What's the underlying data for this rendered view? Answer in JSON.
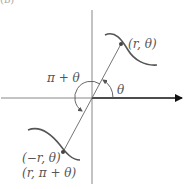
{
  "figure": {
    "corner_label": "(b)",
    "labels": {
      "point_r_theta": "(r, θ)",
      "point_neg_r_theta": "(−r, θ)",
      "point_r_pi_theta": "(r, π + θ)",
      "angle_theta": "θ",
      "angle_pi_plus_theta": "π + θ"
    },
    "colors": {
      "axis": "#777777",
      "curve": "#555555",
      "polar_axis": "#111111",
      "line": "#666666"
    }
  }
}
